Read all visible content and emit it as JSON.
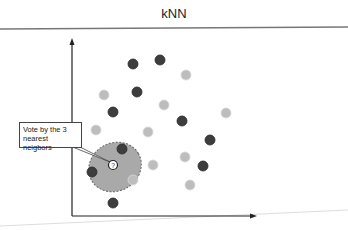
{
  "title": "kNN",
  "callout": {
    "line1": "Vote by the 3",
    "line2": "nearest neigbors"
  },
  "query_label": "?",
  "colors": {
    "dark": "#3d3d3d",
    "light": "#bdbdbd",
    "neighborhood": "#a9a9a9",
    "axis": "#222222"
  },
  "points": {
    "dark": [
      [
        133,
        64
      ],
      [
        160,
        60
      ],
      [
        137,
        92
      ],
      [
        113,
        112
      ],
      [
        182,
        121
      ],
      [
        122,
        149
      ],
      [
        210,
        140
      ],
      [
        92,
        172
      ],
      [
        203,
        166
      ],
      [
        113,
        203
      ]
    ],
    "light": [
      [
        186,
        75
      ],
      [
        104,
        95
      ],
      [
        164,
        105
      ],
      [
        226,
        113
      ],
      [
        96,
        130
      ],
      [
        148,
        132
      ],
      [
        153,
        165
      ],
      [
        185,
        157
      ],
      [
        133,
        180
      ],
      [
        190,
        185
      ]
    ]
  },
  "query_point": [
    113,
    165
  ]
}
